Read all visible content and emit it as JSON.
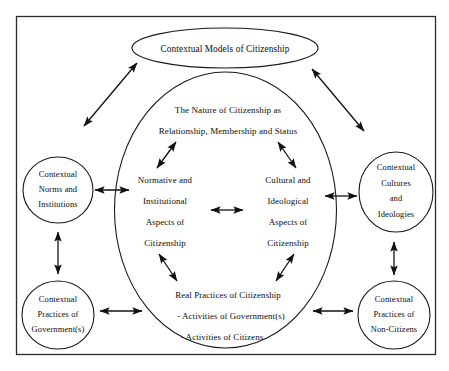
{
  "figure": {
    "background_color": "#ffffff",
    "line_color": "#111111"
  },
  "top_node": {
    "label": "Contextual Models of Citizenship"
  },
  "center": {
    "heading_line1": "The Nature of Citizenship as",
    "heading_line2": "Relationship, Membership and Status",
    "left_aspect": {
      "line1": "Normative and",
      "line2": "Institutional",
      "line3": "Aspects of",
      "line4": "Citizenship"
    },
    "right_aspect": {
      "line1": "Cultural and",
      "line2": "Ideological",
      "line3": "Aspects of",
      "line4": "Citizenship"
    },
    "practices": {
      "line1": "Real Practices of Citizenship",
      "line2": "- Activities of Government(s)",
      "line3": "- Activities of Citizens"
    }
  },
  "side_nodes": {
    "top_left": {
      "line1": "Contextual",
      "line2": "Norms and",
      "line3": "Institutions"
    },
    "top_right": {
      "line1": "Contextual",
      "line2": "Cultures",
      "line3": "and",
      "line4": "Ideologies"
    },
    "bottom_left": {
      "line1": "Contextual",
      "line2": "Practices of",
      "line3": "Government(s)"
    },
    "bottom_right": {
      "line1": "Contextual",
      "line2": "Practices of",
      "line3": "Non-Citizens"
    }
  }
}
